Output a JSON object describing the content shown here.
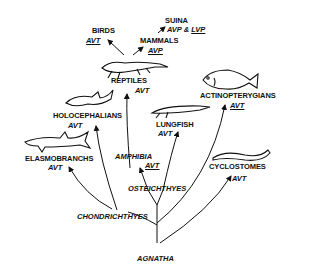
{
  "diagram": {
    "root": "AGNATHA",
    "branches": {
      "chondrichthyes": "CHONDRICHTHYES",
      "osteichthyes": "OSTEICHTHYES"
    },
    "taxa": [
      {
        "id": "birds",
        "name": "BIRDS",
        "hormone": "AVT",
        "underlined": true
      },
      {
        "id": "suina",
        "name": "SUINA",
        "hormone": "AVP & LVP",
        "hormone_parts": [
          "AVP",
          "&",
          "LVP"
        ],
        "underlined": "LVP"
      },
      {
        "id": "mammals",
        "name": "MAMMALS",
        "hormone": "AVP",
        "underlined": true
      },
      {
        "id": "reptiles",
        "name": "REPTILES",
        "hormone": "AVT",
        "underlined": false
      },
      {
        "id": "holocephalians",
        "name": "HOLOCEPHALIANS",
        "hormone": "AVT",
        "underlined": false
      },
      {
        "id": "actinopterygians",
        "name": "ACTINOPTERYGIANS",
        "hormone": "AVT",
        "underlined": true
      },
      {
        "id": "lungfish",
        "name": "LUNGFISH",
        "hormone": "AVT",
        "underlined": false
      },
      {
        "id": "amphibia",
        "name": "AMPHIBIA",
        "hormone": "AVT",
        "underlined": true
      },
      {
        "id": "elasmobranchs",
        "name": "ELASMOBRANCHS",
        "hormone": "AVT",
        "underlined": false
      },
      {
        "id": "cyclostomes",
        "name": "CYCLOSTOMES",
        "hormone": "AVT",
        "underlined": false
      }
    ]
  }
}
